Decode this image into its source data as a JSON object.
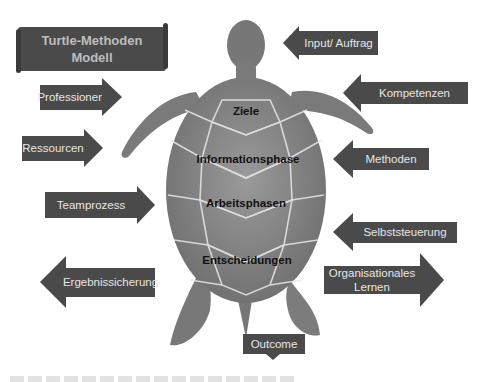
{
  "title": {
    "line1": "Turtle-Methoden",
    "line2": "Modell"
  },
  "colors": {
    "arrow_fill": "#4a4a4a",
    "arrow_text": "#e6e6e6",
    "title_text": "#bdbdbd",
    "turtle": "#7c7c7c",
    "shell_label": "#111111"
  },
  "left_arrows": [
    {
      "label": "Professionen",
      "direction": "right"
    },
    {
      "label": "Ressourcen",
      "direction": "right"
    },
    {
      "label": "Teamprozess",
      "direction": "right"
    },
    {
      "label": "Ergebnissicherung",
      "direction": "left"
    }
  ],
  "right_arrows": [
    {
      "label": "Input/ Auftrag",
      "direction": "left"
    },
    {
      "label": "Kompetenzen",
      "direction": "left"
    },
    {
      "label": "Methoden",
      "direction": "left"
    },
    {
      "label": "Selbststeuerung",
      "direction": "left"
    },
    {
      "label": "Organisationales Lernen",
      "line1": "Organisationales",
      "line2": "Lernen",
      "direction": "right"
    }
  ],
  "shell_labels": [
    "Ziele",
    "Informationsphase",
    "Arbeitsphasen",
    "Entscheidungen"
  ],
  "bottom_arrow": {
    "label": "Outcome",
    "direction": "down"
  }
}
